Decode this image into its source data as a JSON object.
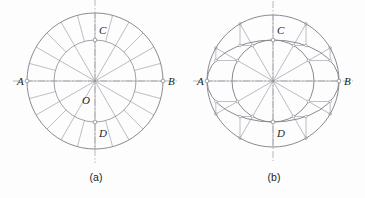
{
  "figure": {
    "background_color": "#fdfdfd",
    "stroke_color": "#8a8a93",
    "axis_color": "#9a9aa2",
    "label_color": "#1d1d1d",
    "panels": [
      {
        "id": "a",
        "caption": "(a)",
        "caption_x": 96,
        "caption_y": 181,
        "center": {
          "x": 95,
          "y": 81
        },
        "outer_radius": 68,
        "inner_radius": 41,
        "spoke_count": 12,
        "spoke_step_deg": 30,
        "axis_overhang": 14,
        "points": [
          {
            "name": "A",
            "label": "A",
            "x": 27,
            "y": 81,
            "label_x": 17,
            "label_y": 85,
            "marker": true
          },
          {
            "name": "B",
            "label": "B",
            "x": 163,
            "y": 81,
            "label_x": 168,
            "label_y": 85,
            "marker": true
          },
          {
            "name": "C",
            "label": "C",
            "x": 95,
            "y": 40,
            "label_x": 99,
            "label_y": 34,
            "marker": true
          },
          {
            "name": "D",
            "label": "D",
            "x": 95,
            "y": 122,
            "label_x": 99,
            "label_y": 137,
            "marker": true
          },
          {
            "name": "O",
            "label": "O",
            "x": 95,
            "y": 81,
            "label_x": 82,
            "label_y": 104,
            "marker": false
          }
        ]
      },
      {
        "id": "b",
        "caption": "(b)",
        "caption_x": 274,
        "caption_y": 181,
        "center": {
          "x": 273,
          "y": 81
        },
        "outer_radius": 66,
        "inner_radius": 41,
        "ellipse_semi_major": 66,
        "ellipse_semi_minor": 41,
        "spoke_count": 12,
        "spoke_step_deg": 30,
        "axis_overhang": 14,
        "trammel_angles_deg": [
          30,
          60,
          120,
          150,
          210,
          240,
          300,
          330
        ],
        "points": [
          {
            "name": "A",
            "label": "A",
            "x": 207,
            "y": 81,
            "label_x": 197,
            "label_y": 85,
            "marker": true
          },
          {
            "name": "B",
            "label": "B",
            "x": 339,
            "y": 81,
            "label_x": 344,
            "label_y": 85,
            "marker": true
          },
          {
            "name": "C",
            "label": "C",
            "x": 273,
            "y": 40,
            "label_x": 277,
            "label_y": 34,
            "marker": true
          },
          {
            "name": "D",
            "label": "D",
            "x": 273,
            "y": 122,
            "label_x": 277,
            "label_y": 137,
            "marker": true
          }
        ]
      }
    ]
  }
}
